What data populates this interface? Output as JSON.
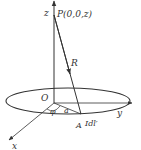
{
  "diagram": {
    "type": "circular current loop with field point on axis",
    "labels": {
      "z_axis": "z",
      "point_p": "P(0,0,z)",
      "r_vector": "R",
      "origin": "O",
      "angle": "φ",
      "radius": "a",
      "point_a": "A",
      "current_element": "Idl′",
      "y_axis": "y",
      "x_axis": "x"
    },
    "colors": {
      "line": "#333333",
      "background": "#ffffff"
    }
  }
}
